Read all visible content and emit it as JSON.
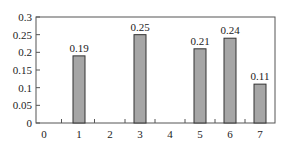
{
  "chart_data": {
    "type": "bar",
    "title": "",
    "xlabel": "",
    "ylabel": "",
    "categories": [
      "0",
      "1",
      "2",
      "3",
      "4",
      "5",
      "6",
      "7"
    ],
    "values": [
      0,
      0.19,
      0,
      0.25,
      0,
      0.21,
      0.24,
      0.11
    ],
    "data_labels": [
      "",
      "0.19",
      "",
      "0.25",
      "",
      "0.21",
      "0.24",
      "0.11"
    ],
    "ylim": [
      0,
      0.3
    ],
    "yticks": [
      "0",
      "0.05",
      "0.1",
      "0.15",
      "0.2",
      "0.25",
      "0.3"
    ],
    "ytick_values": [
      0,
      0.05,
      0.1,
      0.15,
      0.2,
      0.25,
      0.3
    ],
    "grid": false,
    "legend": null,
    "bar_color": "#a6a6a6",
    "bar_edge_color": "#333333"
  }
}
